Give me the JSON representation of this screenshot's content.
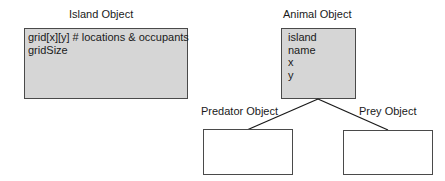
{
  "diagram": {
    "island": {
      "title": "Island Object",
      "fields": [
        "grid[x][y] # locations & occupants",
        "gridSize"
      ]
    },
    "animal": {
      "title": "Animal Object",
      "fields": [
        "island",
        "name",
        "x",
        "y"
      ]
    },
    "predator": {
      "title": "Predator Object",
      "fields": []
    },
    "prey": {
      "title": "Prey Object",
      "fields": []
    },
    "colors": {
      "filled_box": "#d6d6d6",
      "border": "#4a4a4a",
      "line": "#1a1a1a"
    }
  }
}
